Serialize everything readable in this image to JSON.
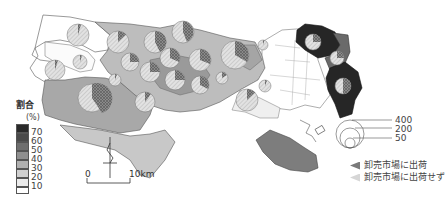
{
  "map": {
    "region": "Tokyo metropolitan area",
    "legend": {
      "title": "割合",
      "unit": "(%)",
      "classes": [
        {
          "label": "70",
          "color": "#2a2a2a"
        },
        {
          "label": "60",
          "color": "#4a4a4a"
        },
        {
          "label": "50",
          "color": "#6e6e6e"
        },
        {
          "label": "40",
          "color": "#8f8f8f"
        },
        {
          "label": "30",
          "color": "#b0b0b0"
        },
        {
          "label": "20",
          "color": "#d0d0d0"
        },
        {
          "label": "10",
          "color": "#ececec"
        },
        {
          "label": "",
          "color": "#ffffff"
        }
      ]
    },
    "size_legend": {
      "values": [
        "400",
        "200",
        "50"
      ]
    },
    "pie_legend": {
      "items": [
        {
          "label": "卸売市場に出荷",
          "fill": "#7a7a7a"
        },
        {
          "label": "卸売市場に出荷せず",
          "fill": "#d6d6d6"
        }
      ]
    },
    "scale_bar": {
      "start": "0",
      "end": "10km"
    },
    "north_arrow": "N"
  }
}
